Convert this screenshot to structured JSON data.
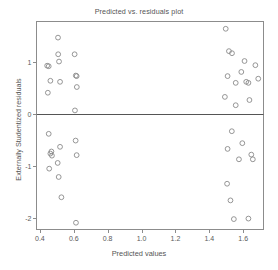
{
  "chart_data": {
    "type": "scatter",
    "title": "Predicted vs. residuals plot",
    "xlabel": "Predicted values",
    "ylabel": "Externally Studentized residuals",
    "xlim": [
      0.38,
      1.72
    ],
    "ylim": [
      -2.22,
      1.78
    ],
    "xticks": [
      0.4,
      0.6,
      0.8,
      1.0,
      1.2,
      1.4,
      1.6
    ],
    "xtick_labels": [
      "0.4",
      "0.6",
      "0.8",
      "1.0",
      "1.2",
      "1.4",
      "1.6"
    ],
    "yticks": [
      1,
      0,
      -1,
      -2
    ],
    "ytick_labels": [
      "1",
      "0",
      "-1",
      "-2"
    ],
    "grid": false,
    "legend": null,
    "reference_lines": [
      {
        "orientation": "horizontal",
        "y": 0,
        "color": "#555555"
      }
    ],
    "marker": {
      "shape": "circle-open",
      "radius": 2.4,
      "stroke": "#8a8a8a",
      "stroke_width": 0.9,
      "fill": "none"
    },
    "points": [
      {
        "x": 0.443,
        "y": 0.93
      },
      {
        "x": 0.452,
        "y": 0.92
      },
      {
        "x": 0.447,
        "y": 0.41
      },
      {
        "x": 0.462,
        "y": 0.64
      },
      {
        "x": 0.507,
        "y": 1.47
      },
      {
        "x": 0.508,
        "y": 1.15
      },
      {
        "x": 0.513,
        "y": 1.01
      },
      {
        "x": 0.519,
        "y": 0.62
      },
      {
        "x": 0.605,
        "y": 1.15
      },
      {
        "x": 0.612,
        "y": 0.74
      },
      {
        "x": 0.617,
        "y": 0.73
      },
      {
        "x": 0.618,
        "y": 0.52
      },
      {
        "x": 0.607,
        "y": 0.07
      },
      {
        "x": 0.452,
        "y": -0.38
      },
      {
        "x": 0.455,
        "y": -1.05
      },
      {
        "x": 0.462,
        "y": -0.76
      },
      {
        "x": 0.468,
        "y": -0.72
      },
      {
        "x": 0.471,
        "y": -0.8
      },
      {
        "x": 0.505,
        "y": -0.94
      },
      {
        "x": 0.511,
        "y": -1.21
      },
      {
        "x": 0.519,
        "y": -0.63
      },
      {
        "x": 0.527,
        "y": -1.6
      },
      {
        "x": 0.611,
        "y": -0.51
      },
      {
        "x": 0.617,
        "y": -0.79
      },
      {
        "x": 0.613,
        "y": -2.09
      },
      {
        "x": 1.497,
        "y": 1.64
      },
      {
        "x": 1.516,
        "y": 1.21
      },
      {
        "x": 1.534,
        "y": 1.17
      },
      {
        "x": 1.608,
        "y": 1.02
      },
      {
        "x": 1.672,
        "y": 0.94
      },
      {
        "x": 1.589,
        "y": 0.81
      },
      {
        "x": 1.508,
        "y": 0.73
      },
      {
        "x": 1.556,
        "y": 0.6
      },
      {
        "x": 1.618,
        "y": 0.62
      },
      {
        "x": 1.631,
        "y": 0.6
      },
      {
        "x": 1.689,
        "y": 0.68
      },
      {
        "x": 1.492,
        "y": 0.33
      },
      {
        "x": 1.556,
        "y": 0.17
      },
      {
        "x": 1.637,
        "y": 0.27
      },
      {
        "x": 1.533,
        "y": -0.33
      },
      {
        "x": 1.595,
        "y": -0.56
      },
      {
        "x": 1.508,
        "y": -0.67
      },
      {
        "x": 1.575,
        "y": -0.87
      },
      {
        "x": 1.648,
        "y": -0.78
      },
      {
        "x": 1.657,
        "y": -0.87
      },
      {
        "x": 1.505,
        "y": -1.34
      },
      {
        "x": 1.525,
        "y": -1.66
      },
      {
        "x": 1.545,
        "y": -2.02
      },
      {
        "x": 1.631,
        "y": -2.01
      }
    ]
  },
  "colors": {
    "frame": "#8c8c8c",
    "marker_stroke": "#8a8a8a",
    "zero_line": "#5a5a5a",
    "text": "#555555",
    "background": "#ffffff"
  }
}
